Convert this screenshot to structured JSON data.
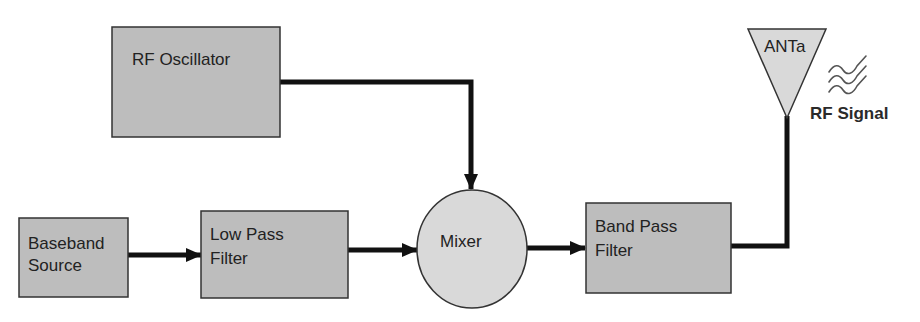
{
  "diagram": {
    "type": "block-diagram",
    "colors": {
      "block_fill": "#bdbdbd",
      "light_fill": "#d9d9d9",
      "stroke": "#333333",
      "connector": "#111111",
      "text": "#222222"
    },
    "blocks": [
      {
        "id": "rf_oscillator",
        "lines": [
          "RF Oscillator"
        ]
      },
      {
        "id": "baseband_source",
        "lines": [
          "Baseband",
          "Source"
        ]
      },
      {
        "id": "low_pass_filter",
        "lines": [
          "Low Pass",
          "Filter"
        ]
      },
      {
        "id": "mixer",
        "lines": [
          "Mixer"
        ]
      },
      {
        "id": "band_pass_filter",
        "lines": [
          "Band Pass",
          "Filter"
        ]
      },
      {
        "id": "antenna",
        "lines": [
          "ANTa"
        ]
      }
    ],
    "signal_label": "RF Signal",
    "connections": [
      {
        "from": "baseband_source",
        "to": "low_pass_filter"
      },
      {
        "from": "low_pass_filter",
        "to": "mixer"
      },
      {
        "from": "rf_oscillator",
        "to": "mixer"
      },
      {
        "from": "mixer",
        "to": "band_pass_filter"
      },
      {
        "from": "band_pass_filter",
        "to": "antenna"
      }
    ],
    "icons": {
      "signal_waves": "radio-waves-icon"
    }
  }
}
